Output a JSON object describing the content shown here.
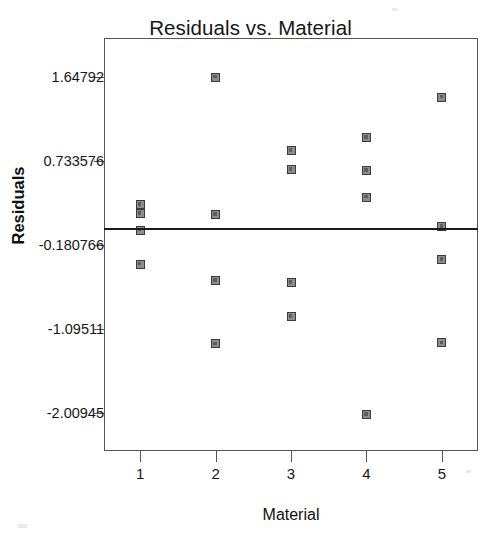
{
  "chart_data": {
    "type": "scatter",
    "title": "Residuals vs. Material",
    "xlabel": "Material",
    "ylabel": "Residuals",
    "grid": false,
    "legend": null,
    "xlim": [
      0.52,
      5.48
    ],
    "ylim": [
      -2.4285,
      2.0765
    ],
    "xticks": [
      1,
      2,
      3,
      4,
      5
    ],
    "xtick_labels": [
      "1",
      "2",
      "3",
      "4",
      "5"
    ],
    "yticks": [
      1.64792,
      0.733576,
      -0.180766,
      -1.09511,
      -2.00945
    ],
    "ytick_labels": [
      "1.64792",
      "0.733576",
      "-0.180766",
      "-1.09511",
      "-2.00945"
    ],
    "reference_line": {
      "orientation": "horizontal",
      "y": 0.0,
      "label": "zero residual line"
    },
    "series": [
      {
        "name": "residuals",
        "marker": "square",
        "color": "#8d8d8d",
        "edge_color": "#3b3b3b",
        "x": [
          1,
          1,
          1,
          1,
          2,
          2,
          2,
          2,
          3,
          3,
          3,
          3,
          4,
          4,
          4,
          4,
          5,
          5,
          5,
          5
        ],
        "y": [
          0.26,
          0.16,
          -0.02,
          -0.39,
          1.65,
          0.15,
          -0.57,
          -1.26,
          0.85,
          0.64,
          -0.59,
          -0.96,
          0.99,
          0.63,
          0.34,
          -2.03,
          1.43,
          0.02,
          -0.34,
          -1.25
        ]
      }
    ],
    "points_by_group": [
      {
        "material": "1",
        "values": [
          0.26,
          0.16,
          -0.02,
          -0.39
        ]
      },
      {
        "material": "2",
        "values": [
          1.65,
          0.15,
          -0.57,
          -1.26
        ]
      },
      {
        "material": "3",
        "values": [
          0.85,
          0.64,
          -0.59,
          -0.96
        ]
      },
      {
        "material": "4",
        "values": [
          0.99,
          0.63,
          0.34,
          -2.03
        ]
      },
      {
        "material": "5",
        "values": [
          1.43,
          0.02,
          -0.34,
          -1.25
        ]
      }
    ]
  },
  "colors": {
    "background": "#ffffff",
    "frame": "#555555",
    "text": "#161616",
    "marker_fill": "#8d8d8d",
    "marker_edge": "#3b3b3b",
    "reference_line": "#1b1b1b"
  }
}
